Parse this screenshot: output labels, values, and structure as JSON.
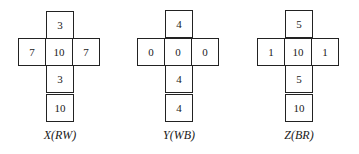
{
  "nets": [
    {
      "label": "X(RW)",
      "top": "3",
      "left": "7",
      "center": "10",
      "right": "7",
      "below": "3",
      "bottom": "10"
    },
    {
      "label": "Y(WB)",
      "top": "4",
      "left": "0",
      "center": "0",
      "right": "0",
      "below": "4",
      "bottom": "4"
    },
    {
      "label": "Z(BR)",
      "top": "5",
      "left": "1",
      "center": "10",
      "right": "1",
      "below": "5",
      "bottom": "10"
    }
  ]
}
